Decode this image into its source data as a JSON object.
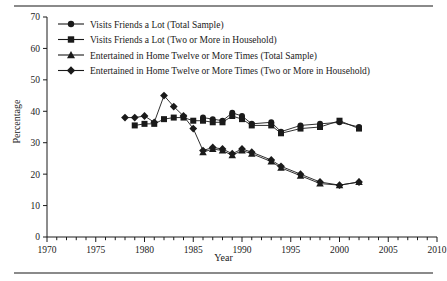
{
  "figure": {
    "ylabel": "Percentage",
    "xlabel": "Year"
  },
  "chart_data": {
    "type": "line",
    "title": "",
    "xlabel": "Year",
    "ylabel": "Percentage",
    "xlim": [
      1970,
      2010
    ],
    "ylim": [
      0,
      70
    ],
    "xticks": [
      1970,
      1975,
      1980,
      1985,
      1990,
      1995,
      2000,
      2005,
      2010
    ],
    "yticks": [
      0,
      10,
      20,
      30,
      40,
      50,
      60,
      70
    ],
    "minor_xticks_every": 1,
    "grid": false,
    "legend_position": "upper-left-inside",
    "series": [
      {
        "name": "Visits Friends a Lot (Total Sample)",
        "marker": "circle",
        "color": "#1a1a1a",
        "x": [
          1986,
          1987,
          1988,
          1989,
          1990,
          1991,
          1993,
          1994,
          1996,
          1998,
          2000,
          2002
        ],
        "values": [
          38.0,
          37.5,
          37.0,
          39.5,
          38.5,
          36.0,
          36.5,
          33.5,
          35.5,
          36.0,
          36.5,
          35.0
        ]
      },
      {
        "name": "Visits Friends a Lot (Two or More in Household)",
        "marker": "square",
        "color": "#1a1a1a",
        "x": [
          1979,
          1980,
          1981,
          1982,
          1983,
          1984,
          1985,
          1986,
          1987,
          1988,
          1989,
          1990,
          1991,
          1993,
          1994,
          1996,
          1998,
          2000,
          2002
        ],
        "values": [
          35.5,
          36.0,
          36.0,
          37.5,
          38.0,
          38.0,
          37.0,
          37.0,
          36.5,
          36.5,
          38.5,
          37.5,
          35.5,
          35.5,
          33.0,
          34.5,
          35.0,
          37.0,
          34.5
        ]
      },
      {
        "name": "Entertained in Home Twelve or More Times (Total Sample)",
        "marker": "triangle",
        "color": "#1a1a1a",
        "x": [
          1986,
          1987,
          1988,
          1989,
          1990,
          1991,
          1993,
          1994,
          1996,
          1998,
          2000,
          2002
        ],
        "values": [
          27.0,
          28.0,
          27.5,
          26.0,
          27.5,
          26.5,
          24.0,
          22.0,
          19.5,
          17.0,
          16.5,
          17.5
        ]
      },
      {
        "name": "Entertained in Home Twelve or More Times (Two or More in Household)",
        "marker": "diamond",
        "color": "#1a1a1a",
        "x": [
          1978,
          1979,
          1980,
          1981,
          1982,
          1983,
          1984,
          1985,
          1986,
          1987,
          1988,
          1989,
          1990,
          1991,
          1993,
          1994,
          1996,
          1998,
          2000,
          2002
        ],
        "values": [
          38.0,
          38.0,
          38.5,
          36.5,
          45.0,
          41.5,
          38.5,
          34.5,
          27.5,
          28.5,
          28.0,
          26.5,
          28.0,
          27.0,
          24.5,
          22.5,
          20.0,
          17.5,
          16.5,
          17.5
        ]
      }
    ],
    "legend": [
      "Visits Friends a Lot (Total Sample)",
      "Visits Friends a Lot (Two or More in Household)",
      "Entertained in Home Twelve or More Times (Total Sample)",
      "Entertained in Home Twelve or More Times (Two or More in Household)"
    ]
  }
}
